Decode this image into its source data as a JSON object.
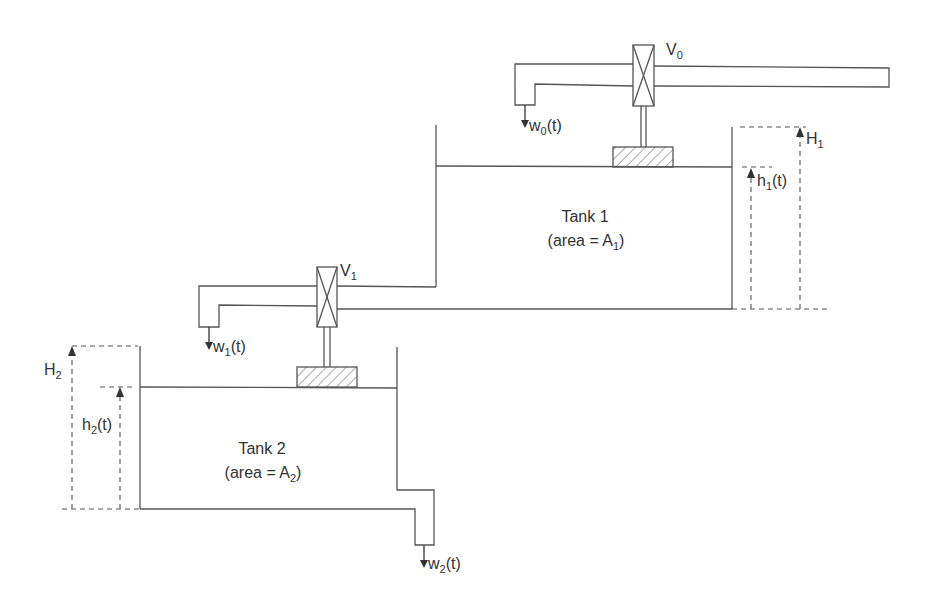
{
  "diagram": {
    "colors": {
      "line": "#555555",
      "text": "#333333",
      "background": "#ffffff"
    },
    "valves": [
      {
        "name": "V",
        "sub": "0"
      },
      {
        "name": "V",
        "sub": "1"
      }
    ],
    "flows": [
      {
        "name": "w",
        "sub": "0",
        "suffix": "(t)"
      },
      {
        "name": "w",
        "sub": "1",
        "suffix": "(t)"
      },
      {
        "name": "w",
        "sub": "2",
        "suffix": "(t)"
      }
    ],
    "tanks": [
      {
        "title": "Tank 1",
        "area_prefix": "(area = A",
        "area_sub": "1",
        "area_suffix": ")",
        "max_height": {
          "name": "H",
          "sub": "1"
        },
        "level": {
          "name": "h",
          "sub": "1",
          "suffix": "(t)"
        }
      },
      {
        "title": "Tank 2",
        "area_prefix": "(area = A",
        "area_sub": "2",
        "area_suffix": ")",
        "max_height": {
          "name": "H",
          "sub": "2"
        },
        "level": {
          "name": "h",
          "sub": "2",
          "suffix": "(t)"
        }
      }
    ]
  }
}
